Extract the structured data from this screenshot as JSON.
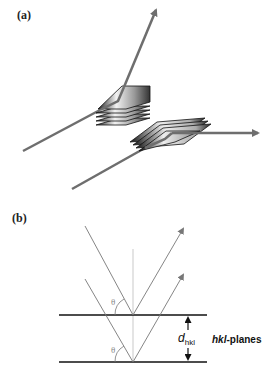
{
  "figure": {
    "panel_a": {
      "label": "(a)",
      "description": "X-ray beams diffracted by stacks of crystal lattice planes at two orientations",
      "beam_color": "#6e6e6e"
    },
    "panel_b": {
      "label": "(b)",
      "theta_upper": "θ",
      "theta_lower": "θ",
      "spacing_label_main": "d",
      "spacing_label_sub": "hkl",
      "planes_label_italic": "hkl",
      "planes_label_rest": "-planes",
      "line_color": "#111111",
      "ray_color": "#777777",
      "normal_color": "#bbbbbb"
    }
  }
}
